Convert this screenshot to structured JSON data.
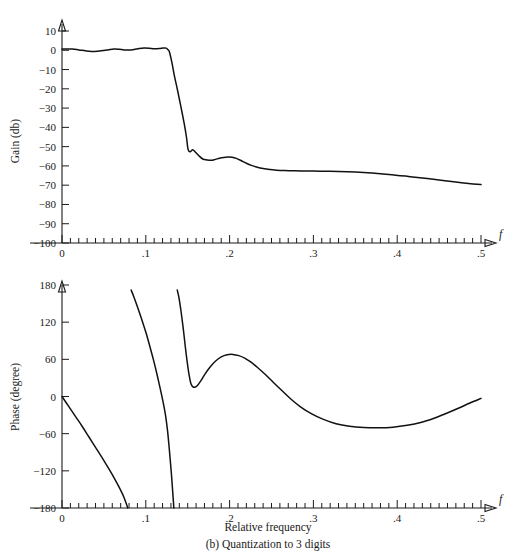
{
  "figure": {
    "caption_axis": "Relative frequency",
    "caption_sub": "(b) Quantization to 3 digits"
  },
  "chart_data": [
    {
      "type": "line",
      "id": "gain-plot",
      "title": "",
      "xlabel": "f",
      "ylabel": "Gain (db)",
      "xlim": [
        0,
        0.5
      ],
      "ylim": [
        -100,
        10
      ],
      "grid": false,
      "legend": null,
      "xticks_major": [
        0,
        0.1,
        0.2,
        0.3,
        0.4,
        0.5
      ],
      "xticklabels": [
        "0",
        ".1",
        ".2",
        ".3",
        ".4",
        ".5"
      ],
      "xtick_minor_step": 0.01,
      "yticks": [
        10,
        0,
        -10,
        -20,
        -30,
        -40,
        -50,
        -60,
        -70,
        -80,
        -90,
        -100
      ],
      "yticklabels": [
        "10",
        "0",
        "−10",
        "−20",
        "−30",
        "−40",
        "−50",
        "−60",
        "−70",
        "−80",
        "−90",
        "−100"
      ],
      "x": [
        0.0,
        0.005,
        0.012,
        0.02,
        0.028,
        0.035,
        0.042,
        0.05,
        0.056,
        0.062,
        0.068,
        0.074,
        0.08,
        0.086,
        0.092,
        0.098,
        0.104,
        0.11,
        0.116,
        0.121,
        0.1245,
        0.126,
        0.128,
        0.131,
        0.134,
        0.138,
        0.142,
        0.146,
        0.1485,
        0.1505,
        0.153,
        0.156,
        0.159,
        0.163,
        0.168,
        0.173,
        0.178,
        0.183,
        0.188,
        0.193,
        0.198,
        0.203,
        0.208,
        0.214,
        0.22,
        0.226,
        0.233,
        0.24,
        0.248,
        0.256,
        0.265,
        0.275,
        0.285,
        0.3,
        0.315,
        0.33,
        0.35,
        0.37,
        0.39,
        0.41,
        0.43,
        0.45,
        0.47,
        0.485,
        0.5
      ],
      "y": [
        0.6,
        0.7,
        0.6,
        0.2,
        -0.3,
        -0.6,
        -0.5,
        -0.1,
        0.3,
        0.6,
        0.5,
        0.2,
        0.1,
        0.4,
        0.9,
        1.2,
        1.1,
        0.8,
        0.9,
        1.2,
        1.1,
        0.4,
        -0.6,
        -6.0,
        -13.0,
        -21.0,
        -29.5,
        -38.5,
        -45.0,
        -51.5,
        -52.6,
        -51.6,
        -52.8,
        -54.6,
        -56.4,
        -56.9,
        -57.1,
        -56.6,
        -56.0,
        -55.6,
        -55.4,
        -55.5,
        -56.1,
        -57.3,
        -58.6,
        -59.7,
        -60.7,
        -61.4,
        -61.9,
        -62.2,
        -62.4,
        -62.5,
        -62.6,
        -62.7,
        -62.8,
        -62.9,
        -63.2,
        -63.7,
        -64.4,
        -65.3,
        -66.3,
        -67.3,
        -68.4,
        -69.1,
        -69.7
      ]
    },
    {
      "type": "line",
      "id": "phase-plot",
      "title": "",
      "xlabel": "f",
      "ylabel": "Phase (degree)",
      "xlim": [
        0,
        0.5
      ],
      "ylim": [
        -180,
        180
      ],
      "grid": false,
      "legend": null,
      "xticks_major": [
        0,
        0.1,
        0.2,
        0.3,
        0.4,
        0.5
      ],
      "xticklabels": [
        "0",
        ".1",
        ".2",
        ".3",
        ".4",
        ".5"
      ],
      "xtick_minor_step": 0.01,
      "yticks": [
        180,
        120,
        60,
        0,
        -60,
        -120,
        -180
      ],
      "yticklabels": [
        "180",
        "120",
        "60",
        "0",
        "−60",
        "−120",
        "−180"
      ],
      "branches": [
        {
          "name": "branch-1",
          "x": [
            0.0,
            0.008,
            0.016,
            0.024,
            0.032,
            0.04,
            0.048,
            0.056,
            0.062,
            0.068,
            0.074,
            0.0785
          ],
          "y": [
            0.0,
            -16.0,
            -32.0,
            -48.0,
            -65.0,
            -82.0,
            -99.0,
            -117.0,
            -131.0,
            -146.0,
            -163.0,
            -180.0
          ]
        },
        {
          "name": "branch-2",
          "x": [
            0.0825,
            0.086,
            0.09,
            0.095,
            0.1,
            0.105,
            0.109,
            0.113,
            0.117,
            0.1205,
            0.1235,
            0.126,
            0.1285,
            0.1305,
            0.132,
            0.1335
          ],
          "y": [
            172.0,
            160.0,
            145.0,
            125.0,
            104.0,
            80.0,
            60.0,
            38.0,
            14.0,
            -8.0,
            -30.0,
            -56.0,
            -92.0,
            -124.0,
            -152.0,
            -180.0
          ]
        },
        {
          "name": "branch-3",
          "x": [
            0.1375,
            0.1395,
            0.142,
            0.1445,
            0.147,
            0.149,
            0.1515,
            0.154,
            0.157,
            0.161,
            0.166,
            0.171,
            0.177,
            0.183,
            0.19,
            0.197,
            0.204,
            0.211,
            0.218,
            0.226,
            0.234,
            0.243,
            0.252,
            0.262,
            0.273,
            0.285,
            0.298,
            0.312,
            0.327,
            0.343,
            0.36,
            0.378,
            0.395,
            0.412,
            0.428,
            0.444,
            0.459,
            0.473,
            0.486,
            0.5
          ],
          "y": [
            172.0,
            160.0,
            138.0,
            112.0,
            82.0,
            60.0,
            36.0,
            20.0,
            15.0,
            17.0,
            26.0,
            37.0,
            48.0,
            57.0,
            64.0,
            67.5,
            68.0,
            66.0,
            62.0,
            55.0,
            46.0,
            35.0,
            23.0,
            10.0,
            -4.0,
            -17.0,
            -28.0,
            -37.0,
            -44.0,
            -48.0,
            -50.0,
            -50.5,
            -49.5,
            -46.5,
            -42.0,
            -35.0,
            -27.0,
            -19.0,
            -11.0,
            -3.0
          ]
        }
      ]
    }
  ]
}
